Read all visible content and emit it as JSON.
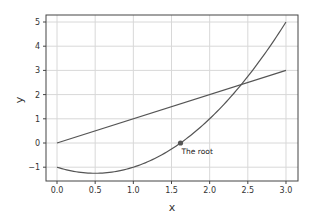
{
  "chart_data": {
    "type": "line",
    "title": "",
    "xlabel": "x",
    "ylabel": "y",
    "xlim": [
      -0.15,
      3.15
    ],
    "ylim": [
      -1.55,
      5.3
    ],
    "grid": true,
    "legend": null,
    "x_ticks": [
      0.0,
      0.5,
      1.0,
      1.5,
      2.0,
      2.5,
      3.0
    ],
    "x_tick_labels": [
      "0.0",
      "0.5",
      "1.0",
      "1.5",
      "2.0",
      "2.5",
      "3.0"
    ],
    "y_ticks": [
      -1,
      0,
      1,
      2,
      3,
      4,
      5
    ],
    "y_tick_labels": [
      "−1",
      "0",
      "1",
      "2",
      "3",
      "4",
      "5"
    ],
    "series": [
      {
        "name": "f(x) = x^2 - x - 1",
        "x": [
          0.0,
          0.25,
          0.5,
          0.75,
          1.0,
          1.25,
          1.5,
          1.75,
          2.0,
          2.25,
          2.5,
          2.75,
          3.0
        ],
        "y": [
          -1.0,
          -1.1875,
          -1.25,
          -1.1875,
          -1.0,
          -0.6875,
          -0.25,
          0.3125,
          1.0,
          1.8125,
          2.75,
          3.8125,
          5.0
        ],
        "color": "#555555"
      },
      {
        "name": "y = x",
        "x": [
          0.0,
          3.0
        ],
        "y": [
          0.0,
          3.0
        ],
        "color": "#555555"
      }
    ],
    "annotations": [
      {
        "text": "The root",
        "x": 1.618,
        "y": 0.0,
        "marker": "circle"
      }
    ]
  },
  "colors": {
    "line": "#555555",
    "grid": "#d8d8d8",
    "frame": "#444444",
    "marker": "#555555"
  }
}
